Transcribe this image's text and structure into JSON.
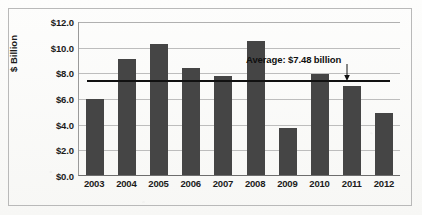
{
  "chart_data": {
    "type": "bar",
    "title": "",
    "xlabel": "",
    "ylabel": "$ Billion",
    "categories": [
      "2003",
      "2004",
      "2005",
      "2006",
      "2007",
      "2008",
      "2009",
      "2010",
      "2011",
      "2012"
    ],
    "values": [
      5.95,
      9.05,
      10.2,
      8.3,
      7.7,
      10.45,
      3.65,
      7.9,
      6.95,
      4.8
    ],
    "ylim": [
      0.0,
      12.0
    ],
    "ytick_step": 2.0,
    "ytick_labels": [
      "$12.0",
      "$10.0",
      "$8.0",
      "$6.0",
      "$4.0",
      "$2.0",
      "$0.0"
    ],
    "ytick_values": [
      12.0,
      10.0,
      8.0,
      6.0,
      4.0,
      2.0,
      0.0
    ],
    "grid": true,
    "legend": false,
    "bar_color": "#454545",
    "reference_line": {
      "label": "Average: $7.48 billion",
      "value": 7.48,
      "color": "#111111"
    },
    "annotations": [
      {
        "name": "average-callout",
        "text": "Average: $7.48 billion"
      }
    ]
  }
}
